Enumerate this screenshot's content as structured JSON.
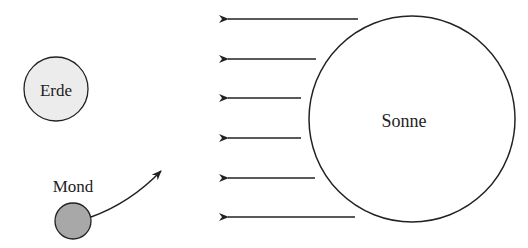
{
  "labels": {
    "earth": "Erde",
    "moon": "Mond",
    "sun": "Sonne"
  },
  "colors": {
    "stroke": "#222222",
    "earth_fill": "#ececec",
    "moon_fill": "#a8a8a8",
    "sun_fill": "#ffffff"
  },
  "sun_rays": [
    {
      "y": 19,
      "x_tail": 358
    },
    {
      "y": 59,
      "x_tail": 316
    },
    {
      "y": 98,
      "x_tail": 301
    },
    {
      "y": 138,
      "x_tail": 301
    },
    {
      "y": 178,
      "x_tail": 315
    },
    {
      "y": 217,
      "x_tail": 355
    }
  ]
}
